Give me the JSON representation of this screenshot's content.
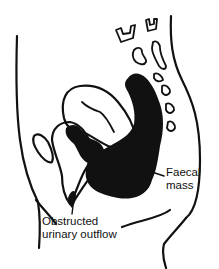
{
  "diagram": {
    "type": "anatomical-sagittal-section",
    "colors": {
      "ink": "#111111",
      "background": "#ffffff"
    },
    "labels": {
      "faecal_mass": {
        "line1": "Faecal",
        "line2": "mass"
      },
      "urinary_outflow": {
        "line1": "Obstructed",
        "line2": "urinary outflow"
      }
    }
  }
}
